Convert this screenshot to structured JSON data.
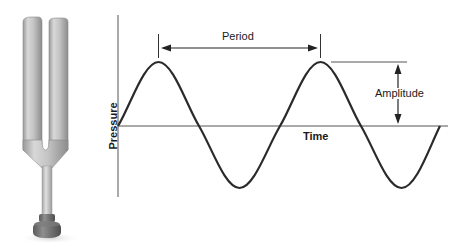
{
  "diagram": {
    "labels": {
      "period": "Period",
      "amplitude": "Amplitude",
      "time_axis": "Time",
      "pressure_axis": "Pressure"
    },
    "illustration": {
      "name": "tuning-fork",
      "description": "Metal tuning fork with two prongs, stem and round base"
    },
    "wave": {
      "type": "sine",
      "cycles_shown": 2,
      "starts_at": "zero crossing, rising",
      "color": "#2a2a2a"
    },
    "colors": {
      "axis": "#555555",
      "wave": "#2a2a2a",
      "annotation": "#1a1a1a",
      "fork_metal_light": "#d4d4d4",
      "fork_metal_dark": "#8a8a8a",
      "fork_base": "#6e6e6e"
    }
  }
}
